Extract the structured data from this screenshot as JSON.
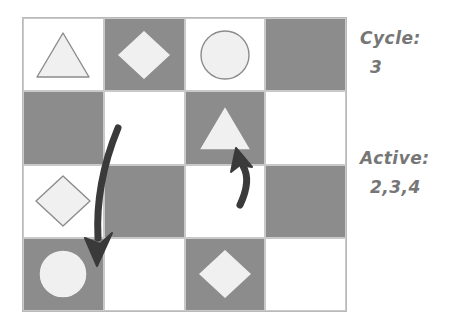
{
  "board": {
    "rows": 4,
    "cols": 4,
    "colors": {
      "light_cell": "#ffffff",
      "dark_cell": "#8c8c8c",
      "shape_fill": "#f0f0f0",
      "shape_stroke": "#8c8c8c",
      "grid_line": "#c9c9c9",
      "arrow": "#3a3a3a",
      "text": "#767676"
    },
    "cells": [
      {
        "row": 1,
        "col": 1,
        "shade": "light",
        "shape": "triangle"
      },
      {
        "row": 1,
        "col": 2,
        "shade": "dark",
        "shape": "diamond"
      },
      {
        "row": 1,
        "col": 3,
        "shade": "light",
        "shape": "circle"
      },
      {
        "row": 1,
        "col": 4,
        "shade": "dark",
        "shape": "none"
      },
      {
        "row": 2,
        "col": 1,
        "shade": "dark",
        "shape": "none"
      },
      {
        "row": 2,
        "col": 2,
        "shade": "light",
        "shape": "none"
      },
      {
        "row": 2,
        "col": 3,
        "shade": "dark",
        "shape": "triangle"
      },
      {
        "row": 2,
        "col": 4,
        "shade": "light",
        "shape": "none"
      },
      {
        "row": 3,
        "col": 1,
        "shade": "light",
        "shape": "diamond"
      },
      {
        "row": 3,
        "col": 2,
        "shade": "dark",
        "shape": "none"
      },
      {
        "row": 3,
        "col": 3,
        "shade": "light",
        "shape": "none"
      },
      {
        "row": 3,
        "col": 4,
        "shade": "dark",
        "shape": "none"
      },
      {
        "row": 4,
        "col": 1,
        "shade": "dark",
        "shape": "circle"
      },
      {
        "row": 4,
        "col": 2,
        "shade": "light",
        "shape": "none"
      },
      {
        "row": 4,
        "col": 3,
        "shade": "dark",
        "shape": "diamond"
      },
      {
        "row": 4,
        "col": 4,
        "shade": "light",
        "shape": "none"
      }
    ]
  },
  "arrows": [
    {
      "name": "long-descending-arrow",
      "from_cell": "r2c2",
      "to_cell": "r4c1",
      "direction": "down-left"
    },
    {
      "name": "short-ascending-arrow",
      "from_cell": "r3c3",
      "to_cell": "r2c3",
      "direction": "up-left"
    }
  ],
  "panel": {
    "cycle": {
      "label": "Cycle:",
      "value": "3"
    },
    "active": {
      "label": "Active:",
      "value": "2,3,4"
    }
  }
}
